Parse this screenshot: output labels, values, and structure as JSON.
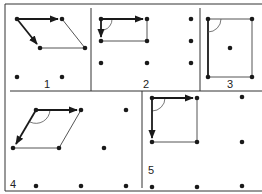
{
  "figure": {
    "panels": [
      {
        "label": "1",
        "shape": "oblique parallelogram"
      },
      {
        "label": "2",
        "shape": "rectangle"
      },
      {
        "label": "3",
        "shape": "centered rectangle"
      },
      {
        "label": "4",
        "shape": "rhombus (hexagonal)"
      },
      {
        "label": "5",
        "shape": "square"
      }
    ]
  },
  "colors": {
    "ink": "#1a1a1a",
    "line": "#555555",
    "background": "#ffffff"
  }
}
